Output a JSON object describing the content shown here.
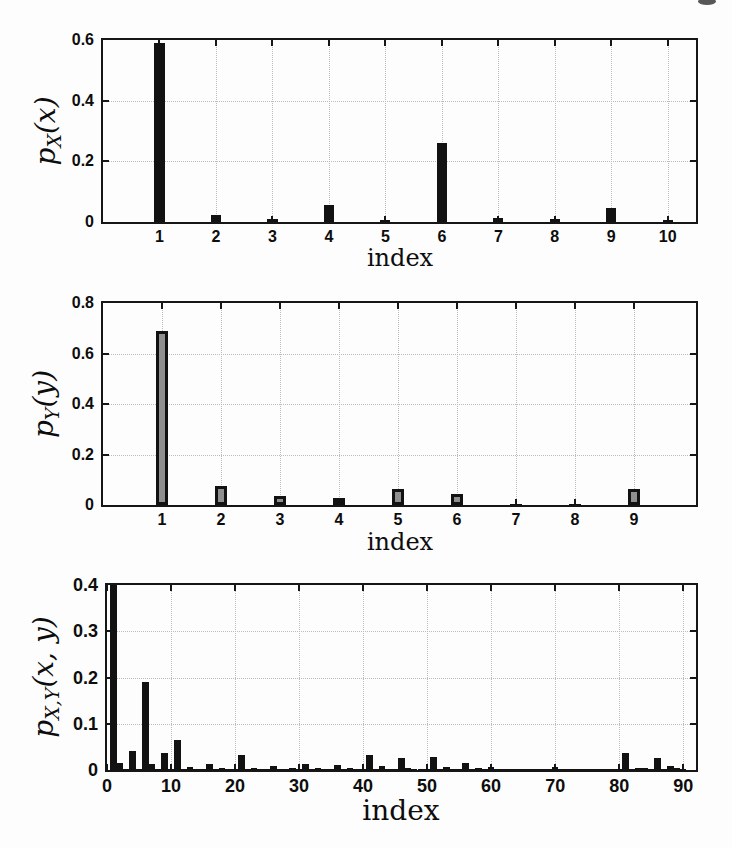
{
  "colors": {
    "bar": "#121212",
    "outlined_bar_fill": "#8f8f8f",
    "axis": "#161616",
    "grid": "#bcbcbc",
    "background": "#fdfdfd"
  },
  "chart_data": [
    {
      "type": "bar",
      "ylabel": {
        "base": "p",
        "sub": "X",
        "arg": "(x)"
      },
      "xlabel": "index",
      "x_start": 1,
      "values": [
        0.59,
        0.022,
        0.009,
        0.055,
        0.008,
        0.26,
        0.013,
        0.009,
        0.047,
        0.006
      ],
      "xtick_values": [
        1,
        2,
        3,
        4,
        5,
        6,
        7,
        8,
        9,
        10
      ],
      "xtick_labels": [
        "1",
        "2",
        "3",
        "4",
        "5",
        "6",
        "7",
        "8",
        "9",
        "10"
      ],
      "ytick_values": [
        0,
        0.2,
        0.4,
        0.6
      ],
      "ytick_labels": [
        "0",
        "0.2",
        "0.4",
        "0.6"
      ],
      "ylim": [
        0,
        0.6
      ],
      "xlim": [
        0,
        10.5
      ],
      "bar_width_units": 0.18,
      "bar_style": "solid",
      "grid": true,
      "legend": "none"
    },
    {
      "type": "bar",
      "ylabel": {
        "base": "p",
        "sub": "Y",
        "arg": "(y)"
      },
      "xlabel": "index",
      "x_start": 1,
      "values": [
        0.69,
        0.075,
        0.035,
        0.028,
        0.065,
        0.042,
        0.005,
        0.005,
        0.065
      ],
      "xtick_values": [
        1,
        2,
        3,
        4,
        5,
        6,
        7,
        8,
        9
      ],
      "xtick_labels": [
        "1",
        "2",
        "3",
        "4",
        "5",
        "6",
        "7",
        "8",
        "9"
      ],
      "ytick_values": [
        0,
        0.2,
        0.4,
        0.6,
        0.8
      ],
      "ytick_labels": [
        "0",
        "0.2",
        "0.4",
        "0.6",
        "0.8"
      ],
      "ylim": [
        0,
        0.8
      ],
      "xlim": [
        0,
        10.05
      ],
      "bar_width_units": 0.2,
      "bar_style": "outlined",
      "grid": true,
      "legend": "none"
    },
    {
      "type": "bar",
      "ylabel": {
        "base": "p",
        "sub": "X,Y",
        "arg": "(x, y)"
      },
      "xlabel": "index",
      "x_start": 1,
      "values": [
        0.4,
        0.015,
        0.002,
        0.042,
        0.002,
        0.19,
        0.014,
        0.002,
        0.036,
        0.002,
        0.065,
        0.002,
        0.006,
        0.002,
        0.002,
        0.014,
        0.002,
        0.004,
        0.002,
        0.002,
        0.032,
        0.002,
        0.005,
        0.002,
        0.002,
        0.008,
        0.002,
        0.002,
        0.005,
        0.002,
        0.012,
        0.002,
        0.004,
        0.002,
        0.002,
        0.01,
        0.002,
        0.005,
        0.002,
        0.002,
        0.033,
        0.002,
        0.009,
        0.002,
        0.002,
        0.026,
        0.005,
        0.002,
        0.002,
        0.002,
        0.028,
        0.002,
        0.006,
        0.002,
        0.002,
        0.015,
        0.002,
        0.005,
        0.002,
        0.006,
        0.002,
        0.002,
        0.002,
        0.002,
        0.002,
        0.002,
        0.002,
        0.002,
        0.002,
        0.006,
        0.002,
        0.002,
        0.002,
        0.002,
        0.002,
        0.002,
        0.002,
        0.002,
        0.002,
        0.002,
        0.036,
        0.002,
        0.005,
        0.005,
        0.002,
        0.026,
        0.002,
        0.009,
        0.004,
        0.003
      ],
      "xtick_values": [
        0,
        10,
        20,
        30,
        40,
        50,
        60,
        70,
        80,
        90
      ],
      "xtick_labels": [
        "0",
        "10",
        "20",
        "30",
        "40",
        "50",
        "60",
        "70",
        "80",
        "90"
      ],
      "ytick_values": [
        0,
        0.1,
        0.2,
        0.3,
        0.4
      ],
      "ytick_labels": [
        "0",
        "0.1",
        "0.2",
        "0.3",
        "0.4"
      ],
      "ylim": [
        0,
        0.4
      ],
      "xlim": [
        0,
        92
      ],
      "bar_width_units": 1.0,
      "bar_style": "solid",
      "grid": true,
      "legend": "none"
    }
  ]
}
